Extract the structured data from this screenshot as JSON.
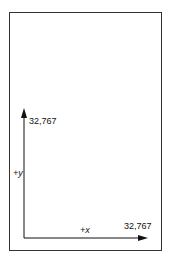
{
  "diagram": {
    "y_max_label": "32,767",
    "y_axis_label": "+y",
    "x_axis_label": "+x",
    "x_max_label": "32,767",
    "colors": {
      "stroke": "#111111",
      "frame": "#333333",
      "background": "#ffffff"
    }
  }
}
